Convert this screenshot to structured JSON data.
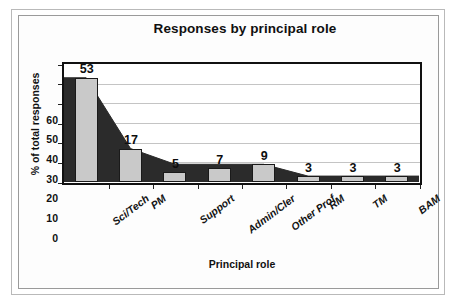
{
  "chart_data": {
    "type": "bar",
    "title": "Responses by principal role",
    "xlabel": "Principal role",
    "ylabel": "% of total responses",
    "categories": [
      "Sci/Tech",
      "PM",
      "Support",
      "Admin/Cler",
      "Other Prof",
      "RM",
      "TM",
      "BAM"
    ],
    "values": [
      53,
      17,
      5,
      7,
      9,
      3,
      3,
      3
    ],
    "data_labels": [
      "53",
      "17",
      "5",
      "7",
      "9",
      "3",
      "3",
      "3"
    ],
    "ylim": [
      0,
      60
    ],
    "yticks": [
      0,
      10,
      20,
      30,
      40,
      50,
      60
    ],
    "ytick_labels": [
      "0",
      "10",
      "20",
      "30",
      "40",
      "50",
      "60"
    ],
    "grid": "horizontal",
    "legend": "none",
    "series": [
      {
        "name": "bars",
        "render": "bar",
        "color": "#c9c9c9",
        "edge_color": "#1a1a1a",
        "values": [
          53,
          17,
          5,
          7,
          9,
          3,
          3,
          3
        ]
      },
      {
        "name": "area",
        "render": "area",
        "color": "#2b2b2b",
        "values": [
          53,
          17,
          9,
          9,
          9,
          3,
          3,
          3
        ]
      }
    ]
  },
  "colors": {
    "bar_fill": "#c9c9c9",
    "bar_edge": "#1a1a1a",
    "area_fill": "#2b2b2b",
    "gridline": "#c4c4c4",
    "axis": "#111111",
    "outer_frame": "#b9b9b9",
    "background": "#ffffff"
  }
}
